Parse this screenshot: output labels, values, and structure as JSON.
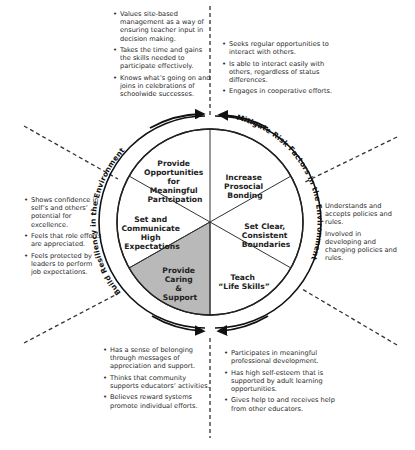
{
  "diagram": {
    "arc_labels": {
      "left": "Build Resiliency in the Environment",
      "right": "Mitigate Risk Factors in the Environment"
    },
    "segments": [
      {
        "id": "participation",
        "lines": [
          "Provide",
          "Opportunities",
          "for",
          "Meaningful",
          "Participation"
        ],
        "shaded": false
      },
      {
        "id": "bonding",
        "lines": [
          "Increase",
          "Prosocial",
          "Bonding"
        ],
        "shaded": false
      },
      {
        "id": "boundaries",
        "lines": [
          "Set Clear,",
          "Consistent",
          "Boundaries"
        ],
        "shaded": false
      },
      {
        "id": "life-skills",
        "lines": [
          "Teach",
          "“Life Skills”"
        ],
        "shaded": false
      },
      {
        "id": "caring",
        "lines": [
          "Provide",
          "Caring",
          "&",
          "Support"
        ],
        "shaded": true
      },
      {
        "id": "expectations",
        "lines": [
          "Set and",
          "Communicate",
          "High",
          "Expectations"
        ],
        "shaded": false
      }
    ],
    "colors": {
      "shaded_segment": "#b9b9b9",
      "line": "#222222",
      "text": "#2a2a2a",
      "background": "#ffffff"
    }
  },
  "bullet_groups": {
    "top_left": [
      "Values site-based management as a way of ensuring teacher input in decision making.",
      "Takes the time and gains the skills needed to participate effectively.",
      "Knows what’s going on and joins in celebrations of schoolwide successes."
    ],
    "top_right": [
      "Seeks regular opportunities to interact with others.",
      "Is able to interact easily with others, regardless of status differences.",
      "Engages in cooperative efforts."
    ],
    "left": [
      "Shows confidence in self’s and others’ potential for excellence.",
      "Feels that role efforts are appreciated.",
      "Feels protected by leaders to perform job expectations."
    ],
    "right": [
      "Understands and accepts policies and rules.",
      "Involved in developing and changing policies and rules."
    ],
    "bottom_left": [
      "Has a sense of belonging through messages of appreciation and support.",
      "Thinks that community supports educators’ activities.",
      "Believes reward systems promote individual efforts."
    ],
    "bottom_right": [
      "Participates in meaningful professional development.",
      "Has high self-esteem that is supported by adult learning opportunities.",
      "Gives help to and receives help from other educators."
    ]
  }
}
